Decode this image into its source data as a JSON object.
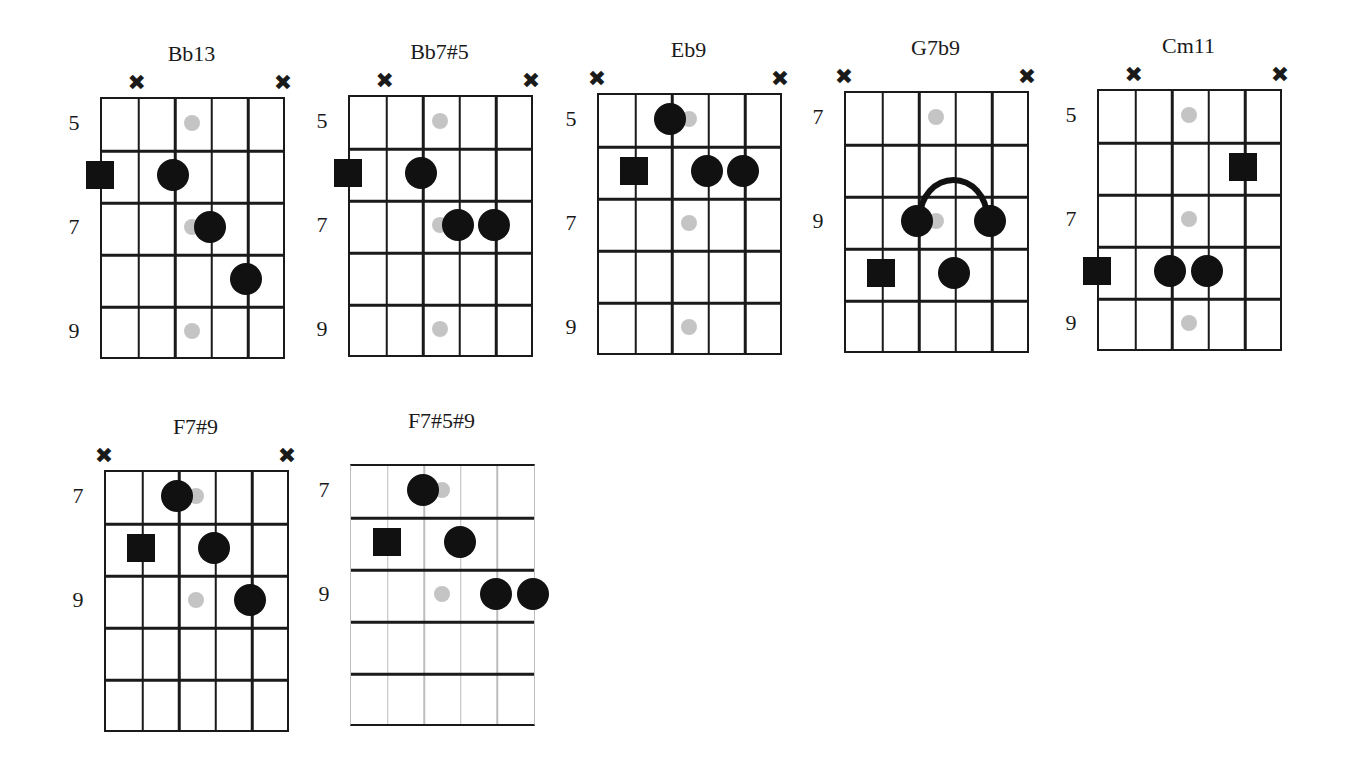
{
  "layout": {
    "col_width": 36.6,
    "row_height": 52,
    "strings": 6,
    "frets": 5
  },
  "colors": {
    "line": "#1a1a1a",
    "note": "#111111",
    "fret_marker": "#c4c4c4",
    "light_string": "#bdbdbd"
  },
  "chords": [
    {
      "name": "Bb13",
      "grid": {
        "left": 100,
        "top": 97,
        "light": false
      },
      "fret_labels": [
        {
          "row": 1,
          "text": "5"
        },
        {
          "row": 3,
          "text": "7"
        },
        {
          "row": 5,
          "text": "9"
        }
      ],
      "muted_strings": [
        2,
        6
      ],
      "fret_markers": [
        1,
        3,
        5
      ],
      "roots": [
        {
          "string": 1,
          "row": 2
        }
      ],
      "notes": [
        {
          "string": 3,
          "row": 2
        },
        {
          "string": 4,
          "row": 3
        },
        {
          "string": 5,
          "row": 4
        }
      ],
      "barre": null
    },
    {
      "name": "Bb7#5",
      "grid": {
        "left": 348,
        "top": 95,
        "light": false
      },
      "fret_labels": [
        {
          "row": 1,
          "text": "5"
        },
        {
          "row": 3,
          "text": "7"
        },
        {
          "row": 5,
          "text": "9"
        }
      ],
      "muted_strings": [
        2,
        6
      ],
      "fret_markers": [
        1,
        3,
        5
      ],
      "roots": [
        {
          "string": 1,
          "row": 2
        }
      ],
      "notes": [
        {
          "string": 3,
          "row": 2
        },
        {
          "string": 4,
          "row": 3
        },
        {
          "string": 5,
          "row": 3
        }
      ],
      "barre": null
    },
    {
      "name": "Eb9",
      "grid": {
        "left": 597,
        "top": 93,
        "light": false
      },
      "fret_labels": [
        {
          "row": 1,
          "text": "5"
        },
        {
          "row": 3,
          "text": "7"
        },
        {
          "row": 5,
          "text": "9"
        }
      ],
      "muted_strings": [
        1,
        6
      ],
      "fret_markers": [
        1,
        3,
        5
      ],
      "roots": [
        {
          "string": 2,
          "row": 2
        }
      ],
      "notes": [
        {
          "string": 3,
          "row": 1
        },
        {
          "string": 4,
          "row": 2
        },
        {
          "string": 5,
          "row": 2
        }
      ],
      "barre": null
    },
    {
      "name": "G7b9",
      "grid": {
        "left": 844,
        "top": 91,
        "light": false
      },
      "fret_labels": [
        {
          "row": 1,
          "text": "7"
        },
        {
          "row": 3,
          "text": "9"
        }
      ],
      "muted_strings": [
        1,
        6
      ],
      "fret_markers": [
        1,
        3
      ],
      "roots": [
        {
          "string": 2,
          "row": 4
        }
      ],
      "notes": [
        {
          "string": 3,
          "row": 3
        },
        {
          "string": 5,
          "row": 3
        },
        {
          "string": 4,
          "row": 4
        }
      ],
      "barre": {
        "from_string": 3,
        "to_string": 5,
        "row": 3
      }
    },
    {
      "name": "Cm11",
      "grid": {
        "left": 1097,
        "top": 89,
        "light": false
      },
      "fret_labels": [
        {
          "row": 1,
          "text": "5"
        },
        {
          "row": 3,
          "text": "7"
        },
        {
          "row": 5,
          "text": "9"
        }
      ],
      "muted_strings": [
        2,
        6
      ],
      "fret_markers": [
        1,
        3,
        5
      ],
      "roots": [
        {
          "string": 5,
          "row": 2
        },
        {
          "string": 1,
          "row": 4
        }
      ],
      "notes": [
        {
          "string": 3,
          "row": 4
        },
        {
          "string": 4,
          "row": 4
        }
      ],
      "barre": null
    },
    {
      "name": "F7#9",
      "grid": {
        "left": 104,
        "top": 470,
        "light": false
      },
      "fret_labels": [
        {
          "row": 1,
          "text": "7"
        },
        {
          "row": 3,
          "text": "9"
        }
      ],
      "muted_strings": [
        1,
        6
      ],
      "fret_markers": [
        1,
        3
      ],
      "roots": [
        {
          "string": 2,
          "row": 2
        }
      ],
      "notes": [
        {
          "string": 3,
          "row": 1
        },
        {
          "string": 4,
          "row": 2
        },
        {
          "string": 5,
          "row": 3
        }
      ],
      "barre": null
    },
    {
      "name": "F7#5#9",
      "grid": {
        "left": 350,
        "top": 464,
        "light": true
      },
      "fret_labels": [
        {
          "row": 1,
          "text": "7"
        },
        {
          "row": 3,
          "text": "9"
        }
      ],
      "muted_strings": [],
      "fret_markers": [
        1,
        3
      ],
      "roots": [
        {
          "string": 2,
          "row": 2
        }
      ],
      "notes": [
        {
          "string": 3,
          "row": 1
        },
        {
          "string": 4,
          "row": 2
        },
        {
          "string": 5,
          "row": 3
        },
        {
          "string": 6,
          "row": 3
        }
      ],
      "barre": null
    }
  ]
}
